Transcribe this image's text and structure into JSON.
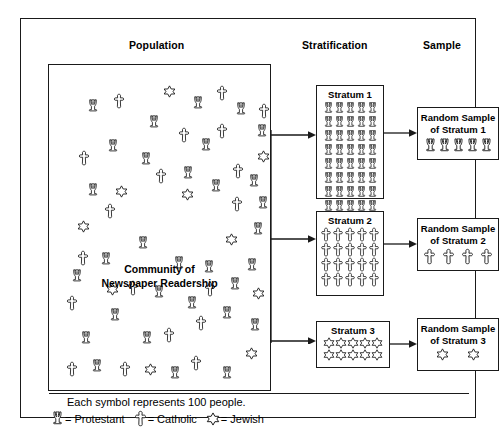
{
  "headers": {
    "population": "Population",
    "stratification": "Stratification",
    "sample": "Sample"
  },
  "population": {
    "label_line1": "Community of",
    "label_line2": "Newspaper Readership",
    "symbols": [
      {
        "type": "protestant",
        "x": 38,
        "y": 33
      },
      {
        "type": "catholic",
        "x": 64,
        "y": 28
      },
      {
        "type": "jewish",
        "x": 114,
        "y": 20
      },
      {
        "type": "protestant",
        "x": 143,
        "y": 30
      },
      {
        "type": "catholic",
        "x": 167,
        "y": 20
      },
      {
        "type": "protestant",
        "x": 186,
        "y": 36
      },
      {
        "type": "catholic",
        "x": 209,
        "y": 38
      },
      {
        "type": "protestant",
        "x": 99,
        "y": 49
      },
      {
        "type": "catholic",
        "x": 129,
        "y": 62
      },
      {
        "type": "catholic",
        "x": 167,
        "y": 58
      },
      {
        "type": "protestant",
        "x": 207,
        "y": 58
      },
      {
        "type": "protestant",
        "x": 151,
        "y": 72
      },
      {
        "type": "protestant",
        "x": 58,
        "y": 73
      },
      {
        "type": "catholic",
        "x": 29,
        "y": 85
      },
      {
        "type": "protestant",
        "x": 91,
        "y": 86
      },
      {
        "type": "jewish",
        "x": 208,
        "y": 85
      },
      {
        "type": "catholic",
        "x": 106,
        "y": 103
      },
      {
        "type": "protestant",
        "x": 133,
        "y": 100
      },
      {
        "type": "catholic",
        "x": 183,
        "y": 98
      },
      {
        "type": "protestant",
        "x": 199,
        "y": 108
      },
      {
        "type": "protestant",
        "x": 38,
        "y": 117
      },
      {
        "type": "jewish",
        "x": 66,
        "y": 120
      },
      {
        "type": "protestant",
        "x": 161,
        "y": 113
      },
      {
        "type": "jewish",
        "x": 132,
        "y": 123
      },
      {
        "type": "catholic",
        "x": 55,
        "y": 138
      },
      {
        "type": "catholic",
        "x": 182,
        "y": 131
      },
      {
        "type": "protestant",
        "x": 208,
        "y": 130
      },
      {
        "type": "jewish",
        "x": 28,
        "y": 155
      },
      {
        "type": "protestant",
        "x": 203,
        "y": 156
      },
      {
        "type": "protestant",
        "x": 88,
        "y": 170
      },
      {
        "type": "jewish",
        "x": 176,
        "y": 168
      },
      {
        "type": "catholic",
        "x": 28,
        "y": 185
      },
      {
        "type": "protestant",
        "x": 51,
        "y": 186
      },
      {
        "type": "protestant",
        "x": 124,
        "y": 190
      },
      {
        "type": "protestant",
        "x": 154,
        "y": 194
      },
      {
        "type": "protestant",
        "x": 197,
        "y": 192
      },
      {
        "type": "protestant",
        "x": 22,
        "y": 203
      },
      {
        "type": "jewish",
        "x": 57,
        "y": 218
      },
      {
        "type": "catholic",
        "x": 78,
        "y": 215
      },
      {
        "type": "protestant",
        "x": 104,
        "y": 219
      },
      {
        "type": "catholic",
        "x": 155,
        "y": 216
      },
      {
        "type": "protestant",
        "x": 180,
        "y": 211
      },
      {
        "type": "jewish",
        "x": 203,
        "y": 222
      },
      {
        "type": "catholic",
        "x": 17,
        "y": 230
      },
      {
        "type": "protestant",
        "x": 137,
        "y": 230
      },
      {
        "type": "protestant",
        "x": 60,
        "y": 242
      },
      {
        "type": "protestant",
        "x": 172,
        "y": 240
      },
      {
        "type": "catholic",
        "x": 146,
        "y": 250
      },
      {
        "type": "protestant",
        "x": 200,
        "y": 252
      },
      {
        "type": "protestant",
        "x": 31,
        "y": 265
      },
      {
        "type": "protestant",
        "x": 92,
        "y": 265
      },
      {
        "type": "catholic",
        "x": 114,
        "y": 262
      },
      {
        "type": "jewish",
        "x": 196,
        "y": 282
      },
      {
        "type": "catholic",
        "x": 17,
        "y": 296
      },
      {
        "type": "protestant",
        "x": 42,
        "y": 293
      },
      {
        "type": "catholic",
        "x": 70,
        "y": 296
      },
      {
        "type": "jewish",
        "x": 95,
        "y": 298
      },
      {
        "type": "protestant",
        "x": 120,
        "y": 300
      },
      {
        "type": "catholic",
        "x": 141,
        "y": 290
      },
      {
        "type": "protestant",
        "x": 172,
        "y": 300
      }
    ]
  },
  "strata": [
    {
      "title": "Stratum 1",
      "symbol": "protestant",
      "cols": 5,
      "rows": 8,
      "count": 40
    },
    {
      "title": "Stratum 2",
      "symbol": "catholic",
      "cols": 5,
      "rows": 4,
      "count": 20
    },
    {
      "title": "Stratum 3",
      "symbol": "jewish",
      "cols": 5,
      "rows": 2,
      "count": 10
    }
  ],
  "samples": [
    {
      "title_line1": "Random Sample",
      "title_line2": "of Stratum 1",
      "symbol": "protestant",
      "count": 5
    },
    {
      "title_line1": "Random Sample",
      "title_line2": "of Stratum 2",
      "symbol": "catholic",
      "count": 4
    },
    {
      "title_line1": "Random Sample",
      "title_line2": "of Stratum 3",
      "symbol": "jewish",
      "count": 2
    }
  ],
  "legend": {
    "note": "Each symbol represents 100 people.",
    "entries": [
      {
        "icon": "protestant-icon",
        "text": "= Protestant"
      },
      {
        "icon": "catholic-icon",
        "text": "= Catholic"
      },
      {
        "icon": "jewish-icon",
        "text": "= Jewish"
      }
    ]
  },
  "colors": {
    "stroke": "#1a1a1a",
    "background": "#ffffff"
  }
}
